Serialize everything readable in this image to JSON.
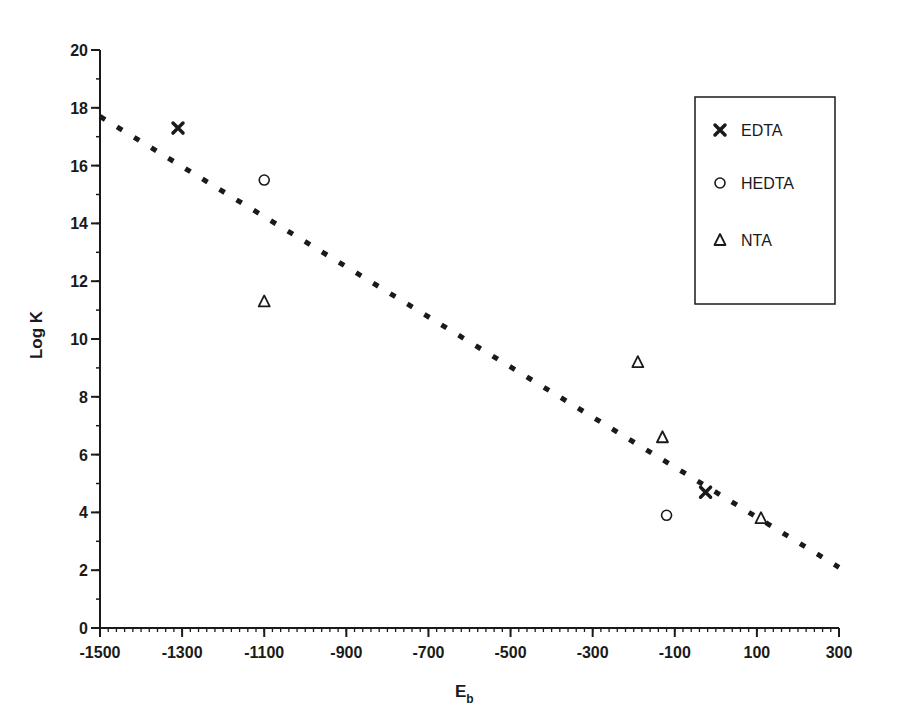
{
  "chart_data": {
    "type": "scatter",
    "title": "",
    "xlabel": "E",
    "xlabel_subscript": "b",
    "ylabel": "Log K",
    "xlim": [
      -1500,
      300
    ],
    "ylim": [
      0,
      20
    ],
    "x_ticks": [
      -1500,
      -1300,
      -1100,
      -900,
      -700,
      -500,
      -300,
      -100,
      100,
      300
    ],
    "x_tick_labels": [
      "-1500",
      "-1300",
      "-1100",
      "-900",
      "-700",
      "-500",
      "-300",
      "-100",
      "100",
      "300"
    ],
    "x_minor_step": 20,
    "y_ticks": [
      0,
      2,
      4,
      6,
      8,
      10,
      12,
      14,
      16,
      18,
      20
    ],
    "y_tick_labels": [
      "0",
      "2",
      "4",
      "6",
      "8",
      "10",
      "12",
      "14",
      "16",
      "18",
      "20"
    ],
    "y_minor_step": 1,
    "grid": false,
    "legend_position": "upper right",
    "series": [
      {
        "name": "EDTA",
        "marker": "x",
        "points": [
          {
            "x": -1310,
            "y": 17.3
          },
          {
            "x": -25,
            "y": 4.7
          }
        ]
      },
      {
        "name": "HEDTA",
        "marker": "circle-open",
        "points": [
          {
            "x": -1100,
            "y": 15.5
          },
          {
            "x": -120,
            "y": 3.9
          }
        ]
      },
      {
        "name": "NTA",
        "marker": "triangle-open",
        "points": [
          {
            "x": -1100,
            "y": 11.3
          },
          {
            "x": -190,
            "y": 9.2
          },
          {
            "x": -130,
            "y": 6.6
          },
          {
            "x": 110,
            "y": 3.8
          }
        ]
      }
    ],
    "fit_line": {
      "style": "dashed",
      "from": {
        "x": -1500,
        "y": 17.7
      },
      "to": {
        "x": 300,
        "y": 2.1
      }
    }
  },
  "legend": {
    "items": [
      {
        "label": "EDTA",
        "marker": "x"
      },
      {
        "label": "HEDTA",
        "marker": "circle-open"
      },
      {
        "label": "NTA",
        "marker": "triangle-open"
      }
    ]
  },
  "colors": {
    "ink": "#1a1a1a",
    "background": "#ffffff"
  }
}
